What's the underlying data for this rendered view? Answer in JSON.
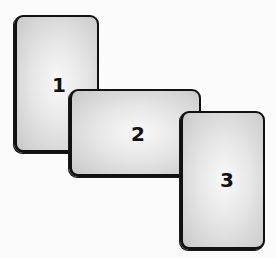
{
  "diagram": {
    "type": "overlapping-cards",
    "cards": [
      {
        "label": "1",
        "x": 14,
        "y": 15,
        "w": 85,
        "h": 138,
        "label_x": 42,
        "label_y": 68
      },
      {
        "label": "2",
        "x": 69,
        "y": 89,
        "w": 132,
        "h": 88,
        "label_x": 68,
        "label_y": 44
      },
      {
        "label": "3",
        "x": 180,
        "y": 111,
        "w": 85,
        "h": 139,
        "label_x": 45,
        "label_y": 68
      }
    ],
    "colors": {
      "border": "#111111",
      "fill_center": "#f9f9f9",
      "fill_edge": "#c9c9c9",
      "background": "#ffffff"
    }
  }
}
